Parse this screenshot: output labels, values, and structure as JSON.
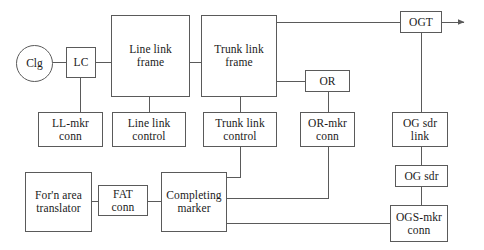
{
  "diagram": {
    "type": "block-diagram",
    "canvas": {
      "width": 484,
      "height": 250
    },
    "line_color": "#5a5a5a",
    "text_color": "#1a1a1a",
    "background_color": "#ffffff",
    "nodes": [
      {
        "id": "clg",
        "label": "Clg",
        "shape": "circle",
        "x": 16,
        "y": 45,
        "w": 37,
        "h": 37
      },
      {
        "id": "lc",
        "label": "LC",
        "shape": "rect",
        "x": 66,
        "y": 47,
        "w": 30,
        "h": 31
      },
      {
        "id": "llf",
        "label": "Line link\nframe",
        "shape": "rect",
        "x": 111,
        "y": 15,
        "w": 79,
        "h": 82
      },
      {
        "id": "tlf",
        "label": "Trunk link\nframe",
        "shape": "rect",
        "x": 201,
        "y": 15,
        "w": 76,
        "h": 82
      },
      {
        "id": "or",
        "label": "OR",
        "shape": "rect",
        "x": 305,
        "y": 70,
        "w": 45,
        "h": 22
      },
      {
        "id": "ogt",
        "label": "OGT",
        "shape": "rect",
        "x": 400,
        "y": 11,
        "w": 42,
        "h": 22
      },
      {
        "id": "llmkr",
        "label": "LL-mkr\nconn",
        "shape": "rect",
        "x": 38,
        "y": 112,
        "w": 65,
        "h": 35
      },
      {
        "id": "llctl",
        "label": "Line link\ncontrol",
        "shape": "rect",
        "x": 112,
        "y": 112,
        "w": 74,
        "h": 35
      },
      {
        "id": "tlctl",
        "label": "Trunk link\ncontrol",
        "shape": "rect",
        "x": 203,
        "y": 112,
        "w": 74,
        "h": 35
      },
      {
        "id": "ormkr",
        "label": "OR-mkr\nconn",
        "shape": "rect",
        "x": 300,
        "y": 112,
        "w": 55,
        "h": 35
      },
      {
        "id": "ogsdrlink",
        "label": "OG sdr\nlink",
        "shape": "rect",
        "x": 392,
        "y": 112,
        "w": 56,
        "h": 35
      },
      {
        "id": "ogsdr",
        "label": "OG sdr",
        "shape": "rect",
        "x": 395,
        "y": 165,
        "w": 53,
        "h": 22
      },
      {
        "id": "ogsmkr",
        "label": "OGS-mkr\nconn",
        "shape": "rect",
        "x": 390,
        "y": 205,
        "w": 58,
        "h": 37
      },
      {
        "id": "fat",
        "label": "For'n area\ntranslator",
        "shape": "rect",
        "x": 25,
        "y": 172,
        "w": 67,
        "h": 60
      },
      {
        "id": "fatconn",
        "label": "FAT\nconn",
        "shape": "rect",
        "x": 98,
        "y": 185,
        "w": 50,
        "h": 31
      },
      {
        "id": "cmkr",
        "label": "Completing\nmarker",
        "shape": "rect",
        "x": 161,
        "y": 172,
        "w": 66,
        "h": 60
      }
    ],
    "edges": [
      {
        "id": "clg-lc",
        "from": "clg",
        "to": "lc",
        "points": "53,62 66,62"
      },
      {
        "id": "lc-llf",
        "from": "lc",
        "to": "llf",
        "points": "96,62 111,62"
      },
      {
        "id": "llf-tlf",
        "from": "llf",
        "to": "tlf",
        "points": "190,62 201,62"
      },
      {
        "id": "tlf-ogt",
        "from": "tlf",
        "to": "ogt",
        "points": "277,22 400,22"
      },
      {
        "id": "ogt-arrow",
        "from": "ogt",
        "to": "outgoing",
        "points": "442,22 464,22",
        "arrow": true
      },
      {
        "id": "tlf-or",
        "from": "tlf",
        "to": "or",
        "points": "277,81 305,81"
      },
      {
        "id": "lc-llmkr",
        "from": "lc",
        "to": "llmkr",
        "points": "80,78 80,112"
      },
      {
        "id": "llf-llctl",
        "from": "llf",
        "to": "llctl",
        "points": "149,97 149,112"
      },
      {
        "id": "tlf-tlctl",
        "from": "tlf",
        "to": "tlctl",
        "points": "240,97 240,112"
      },
      {
        "id": "or-ormkr",
        "from": "or",
        "to": "ormkr",
        "points": "328,92 328,112"
      },
      {
        "id": "ogt-ogsdrlink",
        "from": "ogt",
        "to": "ogsdrlink",
        "points": "421,33 421,112"
      },
      {
        "id": "ogsdrlink-ogsdr",
        "from": "ogsdrlink",
        "to": "ogsdr",
        "points": "421,147 421,165"
      },
      {
        "id": "ogsdr-ogsmkr",
        "from": "ogsdr",
        "to": "ogsmkr",
        "points": "421,187 421,205"
      },
      {
        "id": "fat-fatconn",
        "from": "fat",
        "to": "fatconn",
        "points": "92,201 98,201"
      },
      {
        "id": "fatconn-cmkr",
        "from": "fatconn",
        "to": "cmkr",
        "points": "148,201 161,201"
      },
      {
        "id": "cmkr-tlctl",
        "from": "cmkr",
        "to": "tlctl",
        "points": "227,177 240,177 240,147"
      },
      {
        "id": "cmkr-ormkr",
        "from": "cmkr",
        "to": "ormkr",
        "points": "227,198 328,198 328,147"
      },
      {
        "id": "cmkr-ogsmkr",
        "from": "cmkr",
        "to": "ogsmkr",
        "points": "227,223 390,223"
      }
    ]
  }
}
